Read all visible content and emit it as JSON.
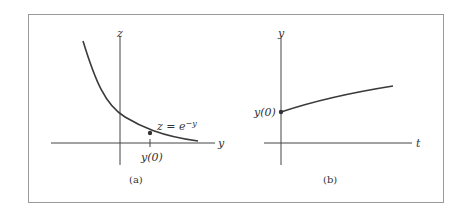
{
  "figure": {
    "panel_a": {
      "caption": "(a)",
      "vertical_axis_label": "z",
      "horizontal_axis_label": "y",
      "curve_label": "z = e",
      "curve_label_exponent": "−y",
      "tick_label": "y(0)"
    },
    "panel_b": {
      "caption": "(b)",
      "vertical_axis_label": "y",
      "horizontal_axis_label": "t",
      "start_label": "y(0)"
    },
    "colors": {
      "frame": "#9a9a9a",
      "axes": "#444444",
      "curve": "#3a3a3a"
    }
  }
}
